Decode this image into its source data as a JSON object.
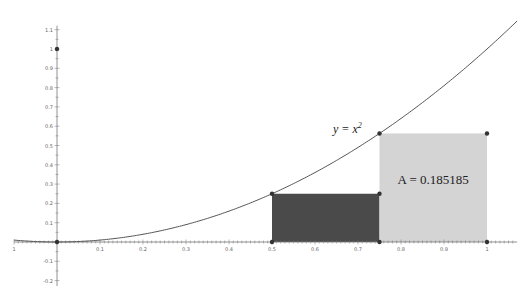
{
  "chart_data": {
    "type": "area",
    "title": "",
    "xlabel": "",
    "ylabel": "",
    "function": {
      "label": "y = x²",
      "label_base": "y = x",
      "label_exp": "2",
      "expression": "x^2",
      "domain": [
        -0.1,
        1.07
      ]
    },
    "xlim": [
      -0.1,
      1.07
    ],
    "ylim": [
      -0.1,
      1.1
    ],
    "grid": false,
    "x_ticks": [
      {
        "value": -0.1,
        "label": "1"
      },
      {
        "value": 0.1,
        "label": "0.1"
      },
      {
        "value": 0.2,
        "label": "0.2"
      },
      {
        "value": 0.3,
        "label": "0.3"
      },
      {
        "value": 0.4,
        "label": "0.4"
      },
      {
        "value": 0.5,
        "label": "0.5"
      },
      {
        "value": 0.6,
        "label": "0.6"
      },
      {
        "value": 0.7,
        "label": "0.7"
      },
      {
        "value": 0.8,
        "label": "0.8"
      },
      {
        "value": 0.9,
        "label": "0.9"
      },
      {
        "value": 1.0,
        "label": "1"
      }
    ],
    "y_ticks": [
      {
        "value": 1.1,
        "label": "1.1"
      },
      {
        "value": 1.0,
        "label": "1"
      },
      {
        "value": 0.9,
        "label": "0.9"
      },
      {
        "value": 0.8,
        "label": "0.8"
      },
      {
        "value": 0.7,
        "label": "0.7"
      },
      {
        "value": 0.6,
        "label": "0.6"
      },
      {
        "value": 0.5,
        "label": "0.5"
      },
      {
        "value": 0.4,
        "label": "0.4"
      },
      {
        "value": 0.3,
        "label": "0.3"
      },
      {
        "value": 0.2,
        "label": "0.2"
      },
      {
        "value": 0.1,
        "label": "0.1"
      },
      {
        "value": -0.1,
        "label": "-0.1"
      },
      {
        "value": -0.2,
        "label": "-0.2"
      }
    ],
    "rectangles": [
      {
        "name": "left-rectangle",
        "x0": 0.5,
        "x1": 0.75,
        "height": 0.25,
        "fill": "#4a4a4a"
      },
      {
        "name": "right-rectangle",
        "x0": 0.75,
        "x1": 1.0,
        "height": 0.5625,
        "fill": "#d4d4d4"
      }
    ],
    "points": [
      {
        "x": 0,
        "y": 0
      },
      {
        "x": 0,
        "y": 1
      },
      {
        "x": 0.5,
        "y": 0
      },
      {
        "x": 0.5,
        "y": 0.25
      },
      {
        "x": 0.75,
        "y": 0
      },
      {
        "x": 0.75,
        "y": 0.25
      },
      {
        "x": 0.75,
        "y": 0.5625
      },
      {
        "x": 1.0,
        "y": 0
      },
      {
        "x": 1.0,
        "y": 0.5625
      }
    ],
    "annotations": [
      {
        "text": "A = 0.185185",
        "x": 0.875,
        "y": 0.3
      }
    ]
  },
  "colors": {
    "curve": "#555555",
    "axis": "#777777",
    "point": "#333333",
    "dark_fill": "#4a4a4a",
    "light_fill": "#d4d4d4",
    "background": "#ffffff"
  }
}
